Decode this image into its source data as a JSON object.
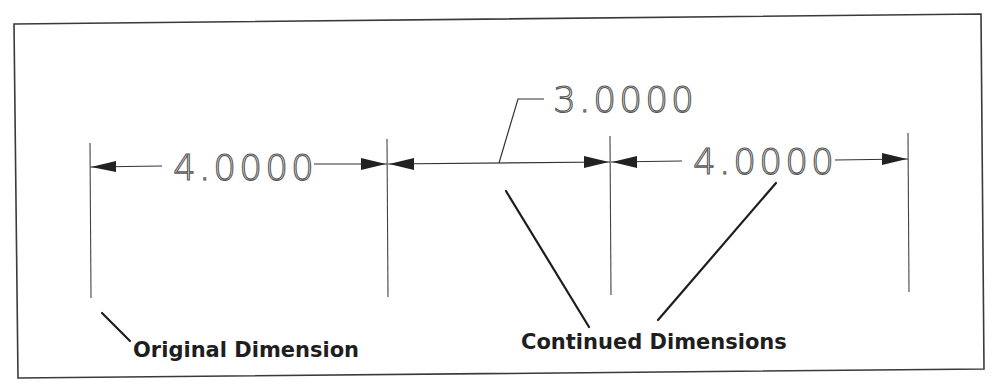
{
  "figure": {
    "type": "cad-continued-dimension-illustration",
    "colors": {
      "background": "#ffffff",
      "frame": "#3a3a3a",
      "geometry": "#2a2a2a",
      "leader": "#1e1e1e",
      "callout_text": "#1e1e1e"
    },
    "dimensions": [
      {
        "label": "4.0000",
        "role": "original"
      },
      {
        "label": "3.0000",
        "role": "continued"
      },
      {
        "label": "4.0000",
        "role": "continued"
      }
    ],
    "callouts": {
      "original": "Original Dimension",
      "continued": "Continued Dimensions"
    }
  }
}
